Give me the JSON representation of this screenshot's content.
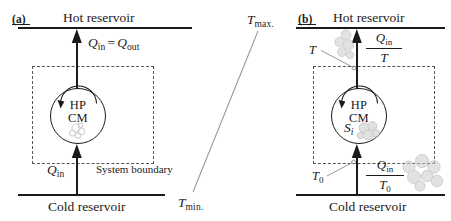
{
  "figure": {
    "type": "thermodynamic-cycle-diagram",
    "background": "#ffffff",
    "ink": "#1a1a1a",
    "accent_gray": "#b8b8b8",
    "boundary_color": "#555555"
  },
  "panel_a": {
    "tag": "(a)",
    "hot_reservoir": "Hot reservoir",
    "cold_reservoir": "Cold reservoir",
    "flow_top": {
      "q_in": "Q",
      "q_in_sub": "in",
      "equals": "=",
      "q_out": "Q",
      "q_out_sub": "out"
    },
    "flow_bottom": {
      "symbol": "Q",
      "sub": "in"
    },
    "engine": {
      "line1": "HP",
      "line2": "CM"
    },
    "system_boundary_label": "System boundary"
  },
  "panel_b": {
    "tag": "(b)",
    "hot_reservoir": "Hot reservoir",
    "cold_reservoir": "Cold reservoir",
    "flux_top": {
      "numerator": "Q",
      "numerator_sub": "in",
      "denominator": "T"
    },
    "flux_bottom": {
      "numerator": "Q",
      "numerator_sub": "in",
      "denominator": "T",
      "denominator_sub": "0"
    },
    "engine": {
      "line1": "HP",
      "line2": "CM"
    },
    "entropy_label": {
      "symbol": "S",
      "sub": "i"
    },
    "temp_top_label": {
      "symbol": "T",
      "sub": ""
    },
    "temp_bottom_label": {
      "symbol": "T",
      "sub": "0"
    }
  },
  "axis_annotation": {
    "max_label": {
      "symbol": "T",
      "sub": "max."
    },
    "min_label": {
      "symbol": "T",
      "sub": "min."
    }
  }
}
